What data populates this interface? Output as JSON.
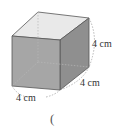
{
  "figure": {
    "shape": "cube",
    "edge_labels": {
      "height": "4 cm",
      "depth": "4 cm",
      "width": "4 cm"
    },
    "colors": {
      "top_face": "#e9e9e9",
      "front_face": "#a6a6a6",
      "right_face": "#8f8f8f",
      "edge": "#555555",
      "hidden_edge": "#9a9a9a",
      "dimension_arc": "#999999"
    }
  },
  "answer": {
    "open_paren": "("
  }
}
